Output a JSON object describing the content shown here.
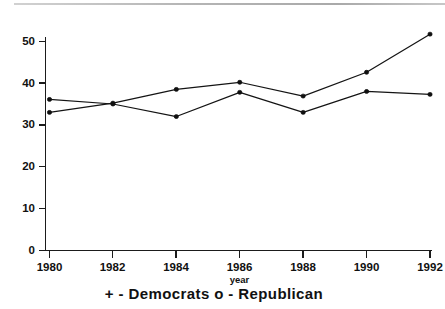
{
  "chart_data": {
    "type": "line",
    "title": "",
    "xlabel": "year",
    "ylabel": "",
    "x": [
      1980,
      1982,
      1984,
      1986,
      1988,
      1990,
      1992
    ],
    "xtick_labels": [
      "1980",
      "1982",
      "1984",
      "1986",
      "1988",
      "1990",
      "1992"
    ],
    "ytick_labels": [
      "0",
      "10",
      "20",
      "30",
      "40",
      "50"
    ],
    "yticks": [
      0,
      10,
      20,
      30,
      40,
      50
    ],
    "xlim": [
      1980,
      1992
    ],
    "ylim": [
      0,
      54
    ],
    "grid": false,
    "legend_position": "below-axis",
    "legend_text": "+ - Democrats o - Republican",
    "series": [
      {
        "name": "Democrats",
        "marker": "+",
        "values": [
          33.0,
          35.2,
          38.5,
          40.2,
          36.9,
          42.6,
          51.7
        ]
      },
      {
        "name": "Republican",
        "marker": "o",
        "values": [
          36.1,
          35.0,
          32.0,
          37.8,
          33.0,
          38.0,
          37.3
        ]
      }
    ]
  },
  "legend": {
    "full": "+ - Democrats o - Republican",
    "democrats_symbol": "+",
    "democrats_label": "Democrats",
    "republican_symbol": "o",
    "republican_label": "Republican",
    "dash": "-"
  },
  "axes": {
    "x_title": "year",
    "y_ticks": [
      "0",
      "10",
      "20",
      "30",
      "40",
      "50"
    ],
    "x_ticks": [
      "1980",
      "1982",
      "1984",
      "1986",
      "1988",
      "1990",
      "1992"
    ]
  },
  "colors": {
    "ink": "#111111",
    "background": "#ffffff",
    "rule": "#a8a8a8"
  }
}
